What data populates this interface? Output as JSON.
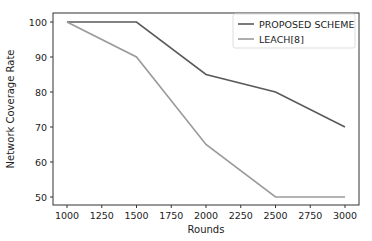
{
  "chart_data": {
    "type": "line",
    "title": "",
    "xlabel": "Rounds",
    "ylabel": "Network Coverage Rate",
    "x": [
      1000,
      1500,
      2000,
      2500,
      3000
    ],
    "series": [
      {
        "name": "PROPOSED SCHEME",
        "values": [
          100,
          100,
          85,
          80,
          70
        ],
        "color": "#5a5a5a"
      },
      {
        "name": "LEACH[8]",
        "values": [
          100,
          90,
          65,
          50,
          50
        ],
        "color": "#9a9a9a"
      }
    ],
    "xticks": [
      1000,
      1250,
      1500,
      1750,
      2000,
      2250,
      2500,
      2750,
      3000
    ],
    "yticks": [
      50,
      60,
      70,
      80,
      90,
      100
    ],
    "xlim": [
      900,
      3100
    ],
    "ylim": [
      47.5,
      102.5
    ],
    "grid": false,
    "legend_position": "upper right"
  }
}
